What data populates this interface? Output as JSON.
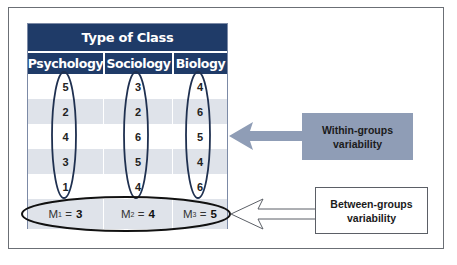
{
  "table": {
    "title": "Type of Class",
    "columns": [
      "Psychology",
      "Sociology",
      "Biology"
    ],
    "rows": [
      [
        "5",
        "3",
        "4"
      ],
      [
        "2",
        "2",
        "6"
      ],
      [
        "4",
        "6",
        "5"
      ],
      [
        "3",
        "5",
        "4"
      ],
      [
        "1",
        "4",
        "6"
      ]
    ],
    "means": [
      {
        "symbol": "M",
        "subscript": "1",
        "equals": " = ",
        "value": "3"
      },
      {
        "symbol": "M",
        "subscript": "2",
        "equals": " = ",
        "value": "4"
      },
      {
        "symbol": "M",
        "subscript": "3",
        "equals": " = ",
        "value": "5"
      }
    ]
  },
  "labels": {
    "within": {
      "line1": "Within-groups",
      "line2": "variability"
    },
    "between": {
      "line1": "Between-groups",
      "line2": "variability"
    }
  },
  "colors": {
    "header": "#1f3b68",
    "stripe": "#dfe3ea",
    "within_arrow": "#8f9db6",
    "ellipse_stroke": "#1f3050"
  }
}
